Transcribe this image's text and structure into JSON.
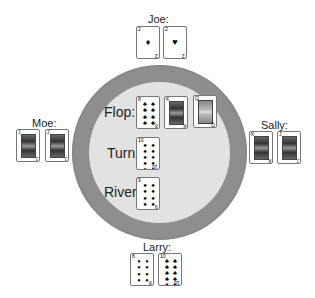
{
  "players": {
    "joe": {
      "name": "Joe:",
      "cards": [
        {
          "rank": "2",
          "suit": "♦",
          "kind": "pip"
        },
        {
          "rank": "2",
          "suit": "♥",
          "kind": "pip"
        }
      ]
    },
    "moe": {
      "name": "Moe:",
      "cards": [
        {
          "rank": "J",
          "suit": "♠",
          "kind": "face"
        },
        {
          "rank": "J",
          "suit": "♣",
          "kind": "face"
        }
      ]
    },
    "sally": {
      "name": "Sally:",
      "cards": [
        {
          "rank": "K",
          "suit": "♣",
          "kind": "face"
        },
        {
          "rank": "J",
          "suit": "♣",
          "kind": "face"
        }
      ]
    },
    "larry": {
      "name": "Larry:",
      "cards": [
        {
          "rank": "8",
          "suit": "♦",
          "kind": "pip"
        },
        {
          "rank": "10",
          "suit": "♣",
          "kind": "pip"
        }
      ]
    }
  },
  "board": {
    "flop_label": "Flop:",
    "turn_label": "Turn:",
    "river_label": "River:",
    "flop": [
      {
        "rank": "8",
        "suit": "♣",
        "kind": "pip"
      },
      {
        "rank": "K",
        "suit": "♠",
        "kind": "face"
      },
      {
        "rank": "Q",
        "suit": "♠",
        "kind": "face"
      }
    ],
    "turn": {
      "rank": "10",
      "suit": "♠",
      "kind": "pip"
    },
    "river": {
      "rank": "9",
      "suit": "♠",
      "kind": "pip"
    }
  },
  "colors": {
    "table_rim": "#8e8e8e",
    "table_felt": "#e2e2e2",
    "background": "#ffffff"
  }
}
